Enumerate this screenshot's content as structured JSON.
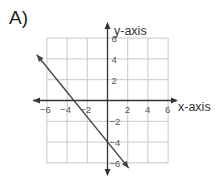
{
  "problem": {
    "label": "A)"
  },
  "colors": {
    "grid": "#c8c8c8",
    "axis": "#333333",
    "line": "#444444",
    "text": "#555555"
  },
  "chart_data": {
    "type": "line",
    "title": "A)",
    "xlabel": "x-axis",
    "ylabel": "y-axis",
    "xlim": [
      -6,
      6
    ],
    "ylim": [
      -6,
      6
    ],
    "grid": true,
    "grid_step": 2,
    "xticks": [
      -6,
      -4,
      -2,
      2,
      4,
      6
    ],
    "yticks": [
      6,
      4,
      2,
      -2,
      -4,
      -6
    ],
    "xtick_labels": [
      "−6",
      "−4",
      "−2",
      "2",
      "4",
      "6"
    ],
    "ytick_labels": [
      "6",
      "4",
      "2",
      "−2",
      "−4",
      "−6"
    ],
    "series": [
      {
        "name": "line",
        "equation": "y = -1.2x - 4",
        "slope": -1.2,
        "y_intercept": -4,
        "x_intercept": -3.33,
        "x": [
          -7,
          -3.33,
          0,
          2.1
        ],
        "y": [
          4.4,
          0,
          -4,
          -6.5
        ],
        "arrows_both_ends": true
      }
    ]
  }
}
